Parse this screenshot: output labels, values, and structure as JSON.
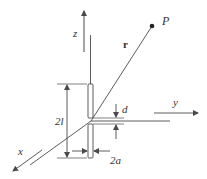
{
  "diagram": {
    "labels": {
      "z_axis": "z",
      "y_axis": "y",
      "x_axis": "x",
      "point": "P",
      "radius_vector": "r",
      "half_length": "2l",
      "gap": "d",
      "diameter": "2a"
    },
    "colors": {
      "line": "#4a4a4a",
      "text": "#333333",
      "background": "#ffffff"
    }
  }
}
